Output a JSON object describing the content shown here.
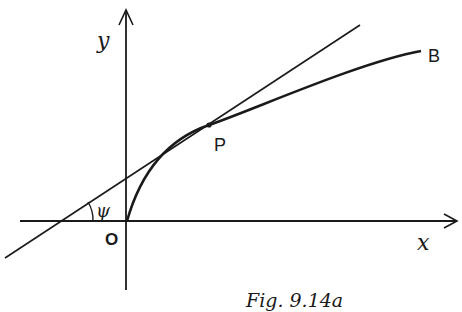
{
  "figure": {
    "caption": "Fig. 9.14a",
    "axes": {
      "x_label": "x",
      "y_label": "y",
      "origin_label": "O"
    },
    "points": [
      {
        "name": "P",
        "label": "P",
        "description": "point of tangency on curve"
      },
      {
        "name": "B",
        "label": "B",
        "description": "end of curve"
      }
    ],
    "angle_label": "ψ",
    "elements": [
      "curve OPB",
      "tangent line at P",
      "angle ψ between tangent and x-axis"
    ],
    "colors": {
      "ink": "#1a1a1a",
      "background": "#ffffff"
    }
  }
}
